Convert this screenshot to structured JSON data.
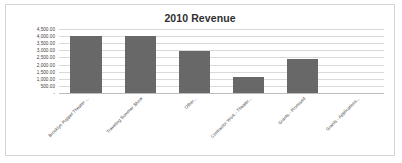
{
  "chart_data": {
    "type": "bar",
    "title": "2010 Revenue",
    "xlabel": "",
    "ylabel": "",
    "categories": [
      "Brooklyn Puppet Theater ...",
      "Traveling Summer Show",
      "Other...",
      "Contractor Work - Theater...",
      "Grants - Promised",
      "Grants - Applications..."
    ],
    "values": [
      4000,
      4000,
      2950,
      1150,
      2400,
      0
    ],
    "ylim": [
      0,
      4500
    ],
    "ytick_labels": [
      "4,500.00",
      "4,000.00",
      "3,500.00",
      "3,000.00",
      "2,500.00",
      "2,000.00",
      "1,500.00",
      "1,000.00",
      "500.00",
      "-"
    ],
    "ytick_values": [
      4500,
      4000,
      3500,
      3000,
      2500,
      2000,
      1500,
      1000,
      500,
      0
    ],
    "grid": true,
    "legend": false,
    "series": [
      {
        "name": "2010 Revenue",
        "values": [
          4000,
          4000,
          2950,
          1150,
          2400,
          0
        ],
        "color": "#686868"
      }
    ],
    "colors": {
      "bar": "#686868",
      "gridline": "#d9d9d9",
      "baseline": "#bdbdbd",
      "border": "#d4d4d4",
      "background": "#ffffff",
      "title_text": "#2f2f2f",
      "axis_text": "#404040"
    }
  }
}
